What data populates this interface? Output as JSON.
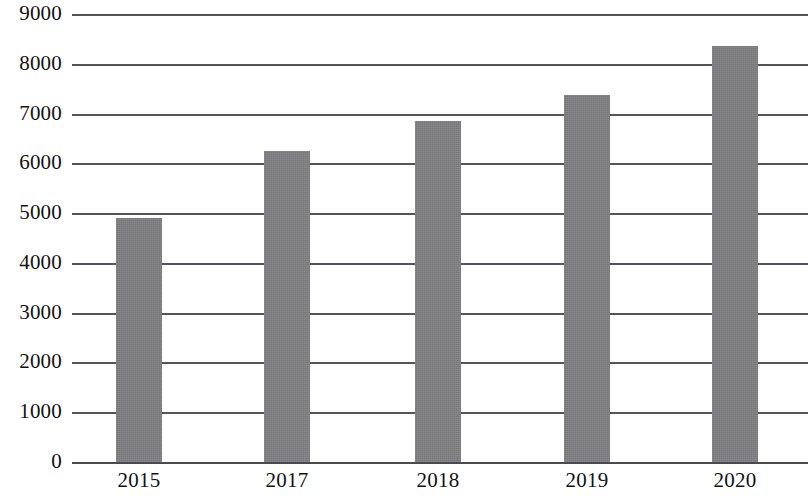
{
  "chart_data": {
    "type": "bar",
    "title": "",
    "subtitle": "",
    "xlabel": "",
    "ylabel": "",
    "categories": [
      "2015",
      "2017",
      "2018",
      "2019",
      "2020"
    ],
    "values": [
      4900,
      6250,
      6850,
      7380,
      8350
    ],
    "series": [
      {
        "name": "",
        "values": [
          4900,
          6250,
          6850,
          7380,
          8350
        ]
      }
    ],
    "ylim": [
      0,
      9000
    ],
    "y_ticks": [
      0,
      1000,
      2000,
      3000,
      4000,
      5000,
      6000,
      7000,
      8000,
      9000
    ],
    "y_tick_labels": [
      "0",
      "1000",
      "2000",
      "3000",
      "4000",
      "5000",
      "6000",
      "7000",
      "8000",
      "9000"
    ],
    "grid": true,
    "grid_axis": "y",
    "legend": false,
    "legend_position": "none",
    "annotations": [],
    "bar_color": "#807f83",
    "grid_color": "#55545a",
    "axis_color": "#4a4950",
    "background_color": "#ffffff",
    "text_color": "#121212"
  }
}
